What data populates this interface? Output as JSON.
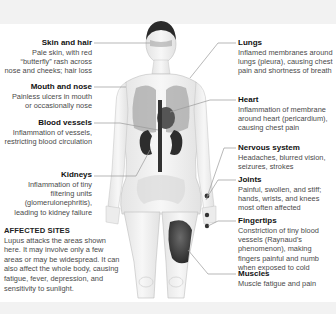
{
  "diagram": {
    "left_labels": [
      {
        "title": "Skin and hair",
        "desc": "Pale skin, with red “butterfly” rash across nose and cheeks; hair loss"
      },
      {
        "title": "Mouth and nose",
        "desc": "Painless ulcers in mouth or occasionally nose"
      },
      {
        "title": "Blood vessels",
        "desc": "Inflammation of vessels, restricting blood circulation"
      },
      {
        "title": "Kidneys",
        "desc": "Inflammation of tiny filtering units (glomerulonephritis), leading to kidney failure"
      }
    ],
    "right_labels": [
      {
        "title": "Lungs",
        "desc": "Inflamed membranes around lungs (pleura), causing chest pain and shortness of breath"
      },
      {
        "title": "Heart",
        "desc": "Inflammation of membrane around heart (pericardium), causing chest pain"
      },
      {
        "title": "Nervous system",
        "desc": "Headaches, blurred vision, seizures, strokes"
      },
      {
        "title": "Joints",
        "desc": "Painful, swollen, and stiff; hands, wrists, and knees most often affected"
      },
      {
        "title": "Fingertips",
        "desc": "Constriction of tiny blood vessels (Raynaud’s phenomenon), making fingers painful and numb when exposed to cold"
      },
      {
        "title": "Muscles",
        "desc": "Muscle fatigue and pain"
      }
    ],
    "affected_sites": {
      "heading": "AFFECTED SITES",
      "text": "Lupus attacks the areas shown here. It may involve only a few areas or may be widespread. It can also affect the whole body, causing fatigue, fever, depression, and sensitivity to sunlight."
    },
    "colors": {
      "band": "#f2f2f2",
      "leader_line": "#9a9a9a",
      "organ_dark": "#3c3c3c",
      "body_outline": "#b8b8b8"
    }
  }
}
